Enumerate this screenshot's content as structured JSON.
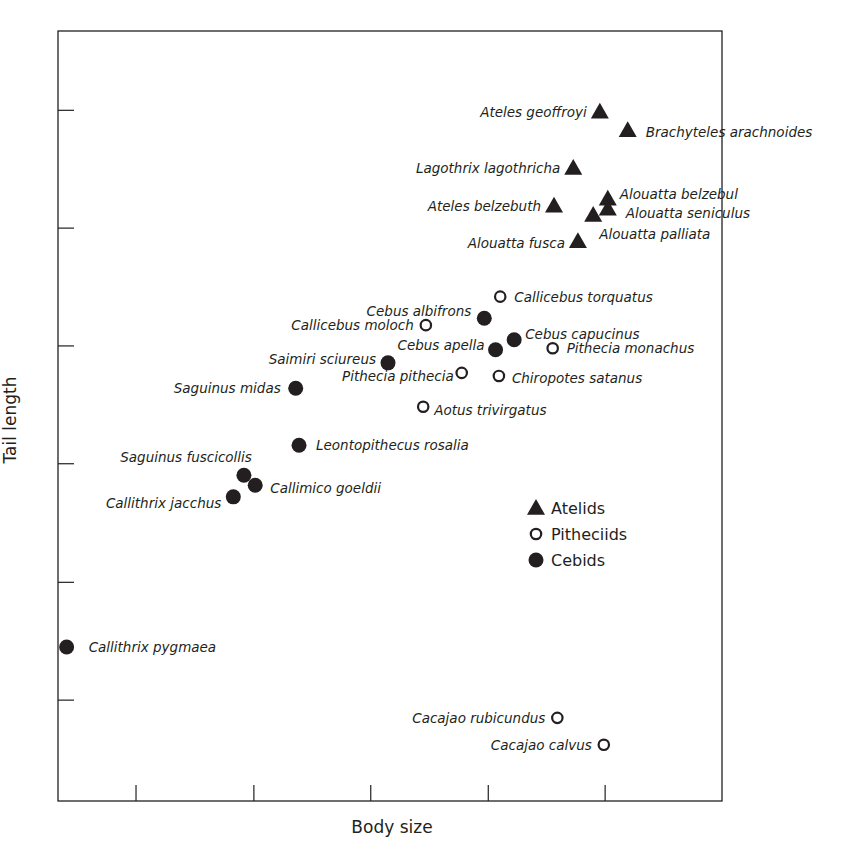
{
  "chart_data": {
    "type": "scatter",
    "title": "",
    "xlabel": "Body size",
    "ylabel": "Tail length",
    "xlim": [
      0,
      100
    ],
    "ylim": [
      0,
      100
    ],
    "grid": false,
    "x_ticks_unlabeled": [
      11.75,
      29.5,
      47.1,
      64.8,
      82.4
    ],
    "y_ticks_unlabeled": [
      13.1,
      28.4,
      43.8,
      59.1,
      74.4,
      89.7
    ],
    "legend": {
      "position": "inside-lower-right",
      "entries": [
        {
          "name": "Atelids",
          "marker": "triangle-filled"
        },
        {
          "name": "Pitheciids",
          "marker": "circle-open"
        },
        {
          "name": "Cebids",
          "marker": "circle-filled"
        }
      ]
    },
    "series": [
      {
        "name": "Atelids",
        "marker": "triangle-filled",
        "points": [
          {
            "label": "Ateles geoffroyi",
            "x": 81.6,
            "y": 89.5
          },
          {
            "label": "Brachyteles arachnoides",
            "x": 85.8,
            "y": 87.1
          },
          {
            "label": "Lagothrix lagothricha",
            "x": 77.6,
            "y": 82.2
          },
          {
            "label": "Ateles belzebuth",
            "x": 74.7,
            "y": 77.3
          },
          {
            "label": "Alouatta belzebul",
            "x": 82.8,
            "y": 78.2
          },
          {
            "label": "Alouatta seniculus",
            "x": 82.8,
            "y": 76.9
          },
          {
            "label": "Alouatta palliata",
            "x": 80.6,
            "y": 76.1
          },
          {
            "label": "Alouatta fusca",
            "x": 78.3,
            "y": 72.7
          }
        ]
      },
      {
        "name": "Pitheciids",
        "marker": "circle-open",
        "points": [
          {
            "label": "Callicebus torquatus",
            "x": 66.6,
            "y": 65.5
          },
          {
            "label": "Callicebus moloch",
            "x": 55.4,
            "y": 61.8
          },
          {
            "label": "Pithecia monachus",
            "x": 74.5,
            "y": 58.8
          },
          {
            "label": "Pithecia pithecia",
            "x": 60.8,
            "y": 55.6
          },
          {
            "label": "Chiropotes satanus",
            "x": 66.4,
            "y": 55.2
          },
          {
            "label": "Aotus trivirgatus",
            "x": 55.0,
            "y": 51.2
          },
          {
            "label": "Cacajao rubicundus",
            "x": 75.2,
            "y": 10.8
          },
          {
            "label": "Cacajao calvus",
            "x": 82.2,
            "y": 7.3
          }
        ]
      },
      {
        "name": "Cebids",
        "marker": "circle-filled",
        "points": [
          {
            "label": "Cebus albifrons",
            "x": 64.2,
            "y": 62.7
          },
          {
            "label": "Cebus capucinus",
            "x": 68.7,
            "y": 59.9
          },
          {
            "label": "Cebus apella",
            "x": 65.9,
            "y": 58.6
          },
          {
            "label": "Saimiri sciureus",
            "x": 49.7,
            "y": 56.9
          },
          {
            "label": "Saguinus midas",
            "x": 35.8,
            "y": 53.6
          },
          {
            "label": "Leontopithecus rosalia",
            "x": 36.3,
            "y": 46.2
          },
          {
            "label": "Saguinus fuscicollis",
            "x": 28.0,
            "y": 42.3
          },
          {
            "label": "Callimico goeldii",
            "x": 29.7,
            "y": 41.0
          },
          {
            "label": "Callithrix jacchus",
            "x": 26.4,
            "y": 39.5
          },
          {
            "label": "Callithrix pygmaea",
            "x": 1.3,
            "y": 20.0
          }
        ]
      }
    ]
  },
  "colors": {
    "ink": "#231f20",
    "background": "#ffffff"
  }
}
